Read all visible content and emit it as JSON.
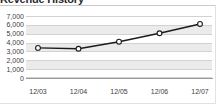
{
  "widget": {
    "title": "Revenue History",
    "background_color": "#ffffff",
    "band_color": "#ebebeb",
    "gridline_color": "#d2d2d2",
    "axis_color": "#9a9a9a",
    "tick_label_color": "#3d3d3d"
  },
  "chart_data": {
    "type": "line",
    "title": "Revenue History",
    "xlabel": "",
    "ylabel": "",
    "categories": [
      "12/03",
      "12/04",
      "12/05",
      "12/06",
      "12/07"
    ],
    "values": [
      3400,
      3300,
      4100,
      5050,
      6100
    ],
    "series": [
      {
        "name": "Revenue",
        "values": [
          3400,
          3300,
          4100,
          5050,
          6100
        ],
        "line_color": "#1b1b1b",
        "marker_fill": "#ffffff",
        "marker_shape": "circle"
      }
    ],
    "ylim": [
      0,
      7000
    ],
    "ytick_values": [
      7000,
      6000,
      5000,
      4000,
      3000,
      2000,
      1000,
      0
    ],
    "ytick_labels": [
      "7,000",
      "6,000",
      "5,000",
      "4,000",
      "3,000",
      "2,000",
      "1,000",
      "0"
    ],
    "xtick_labels": [
      "12/03",
      "12/04",
      "12/05",
      "12/06",
      "12/07"
    ],
    "grid": true,
    "grid_orientation": "horizontal",
    "banded_background": true,
    "legend": null,
    "legend_position": "none",
    "annotations": []
  }
}
